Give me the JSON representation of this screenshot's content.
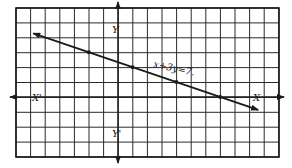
{
  "chart_data": {
    "type": "line",
    "title": "",
    "equation_label": "x+3y=7.",
    "xlabel_pos": "X",
    "xlabel_neg": "X'",
    "ylabel_pos": "Y",
    "ylabel_neg": "Y'",
    "grid": true,
    "xlim": [
      -7,
      11
    ],
    "ylim": [
      -4,
      6
    ],
    "series": [
      {
        "name": "x+3y=7",
        "x": [
          -5.8,
          9.6
        ],
        "y": [
          4.27,
          -0.87
        ],
        "points": [
          {
            "x": -2,
            "y": 3
          },
          {
            "x": 1,
            "y": 2
          },
          {
            "x": 4,
            "y": 1
          },
          {
            "x": 7,
            "y": 0
          }
        ],
        "arrows_both_ends": true
      }
    ]
  },
  "colors": {
    "ink": "#1a1a1a",
    "grid": "#2a2a2a",
    "background": "#ffffff"
  }
}
